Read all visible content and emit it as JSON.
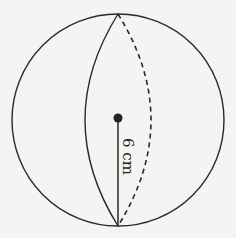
{
  "diagram": {
    "radius_label": "6 cm",
    "colors": {
      "stroke": "#2a2a2a",
      "background": "#f4f4f2"
    },
    "elements": [
      {
        "type": "circle",
        "name": "sphere-outline"
      },
      {
        "type": "solid-arc",
        "name": "front-meridian"
      },
      {
        "type": "dashed-arc",
        "name": "hidden-meridian"
      },
      {
        "type": "point",
        "name": "center-point"
      },
      {
        "type": "segment",
        "name": "radius-line",
        "label": "6 cm"
      }
    ]
  }
}
